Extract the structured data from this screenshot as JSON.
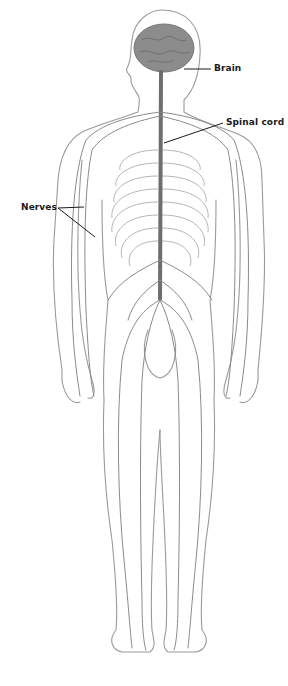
{
  "diagram": {
    "labels": [
      {
        "id": "brain",
        "text": "Brain"
      },
      {
        "id": "spinal_cord",
        "text": "Spinal cord"
      },
      {
        "id": "nerves",
        "text": "Nerves"
      }
    ],
    "colors": {
      "outline": "#9a9a9a",
      "nerve": "#8a8a8a",
      "spine": "#6e6e6e",
      "brain": "#8c8c8c",
      "ribs": "#b5b5b5",
      "leader_line": "#1a1a1a"
    }
  }
}
